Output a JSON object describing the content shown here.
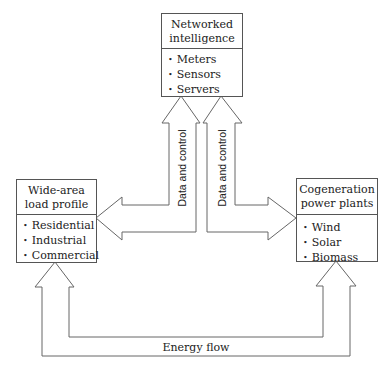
{
  "diagram": {
    "nodes": [
      {
        "id": "top",
        "title_lines": [
          "Networked",
          "intelligence"
        ],
        "items": [
          "Meters",
          "Sensors",
          "Servers"
        ]
      },
      {
        "id": "left",
        "title_lines": [
          "Wide-area",
          "load profile"
        ],
        "items": [
          "Residential",
          "Industrial",
          "Commercial"
        ]
      },
      {
        "id": "right",
        "title_lines": [
          "Cogeneration",
          "power plants"
        ],
        "items": [
          "Wind",
          "Solar",
          "Biomass"
        ]
      }
    ],
    "edges": {
      "data_left": "Data and control",
      "data_right": "Data and control",
      "energy": "Energy flow"
    },
    "colors": {
      "stroke": "#666666",
      "text": "#222222"
    }
  }
}
